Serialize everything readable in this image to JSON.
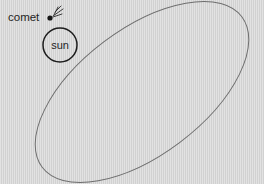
{
  "figure": {
    "kind": "astronomy-diagram",
    "background_color": "#d6d6d6",
    "orbit_color": "#6e6e6e",
    "sun_outline_color": "#1d1d1d",
    "comet_color": "#161616",
    "text_color": "#1f1f1f"
  },
  "labels": {
    "comet": "comet",
    "sun": "sun"
  },
  "icons": {
    "comet": "comet-icon",
    "sun": "sun-icon",
    "orbit": "orbit-ellipse-icon"
  },
  "geometry": {
    "canvas": {
      "width": 264,
      "height": 184
    },
    "orbit_ellipse": {
      "center_x": 142,
      "center_y": 92,
      "semi_major": 125,
      "semi_minor": 63,
      "rotation_deg": -37
    },
    "sun": {
      "center_x": 60,
      "center_y": 45,
      "radius": 17
    },
    "comet": {
      "x": 50,
      "y": 18,
      "radius": 2.6
    },
    "comet_label": {
      "x": 8,
      "y": 21
    }
  }
}
